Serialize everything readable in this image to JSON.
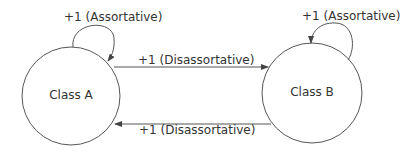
{
  "nodes": [
    {
      "id": "A",
      "label": "Class A"
    },
    {
      "id": "B",
      "label": "Class B"
    }
  ],
  "edges": [
    {
      "from": "A",
      "to": "A",
      "label": "+1 (Assortative)"
    },
    {
      "from": "B",
      "to": "B",
      "label": "+1 (Assortative)"
    },
    {
      "from": "A",
      "to": "B",
      "label": "+1 (Disassortative)"
    },
    {
      "from": "B",
      "to": "A",
      "label": "+1 (Disassortative)"
    }
  ],
  "colors": {
    "stroke": "#444444",
    "text": "#333333",
    "background": "#ffffff"
  }
}
